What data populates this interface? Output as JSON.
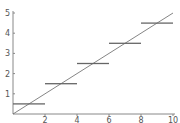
{
  "chart_data": {
    "type": "line",
    "title": "",
    "xlabel": "",
    "ylabel": "",
    "xlim": [
      0,
      10
    ],
    "ylim": [
      0,
      5
    ],
    "grid": false,
    "legend": null,
    "x_ticks": [
      "2",
      "4",
      "6",
      "8",
      "10"
    ],
    "y_ticks": [
      "1",
      "2",
      "3",
      "4",
      "5"
    ],
    "series": [
      {
        "name": "line",
        "kind": "line",
        "x": [
          0,
          10
        ],
        "y": [
          0,
          5
        ]
      },
      {
        "name": "steps",
        "kind": "horizontal-segments",
        "segments": [
          {
            "x0": 0,
            "x1": 2,
            "y": 0.5
          },
          {
            "x0": 2,
            "x1": 4,
            "y": 1.5
          },
          {
            "x0": 4,
            "x1": 6,
            "y": 2.5
          },
          {
            "x0": 6,
            "x1": 8,
            "y": 3.5
          },
          {
            "x0": 8,
            "x1": 10,
            "y": 4.5
          }
        ]
      }
    ]
  },
  "colors": {
    "axis": "#888888",
    "line": "#666666",
    "steps": "#666666",
    "tick_label": "#555555"
  }
}
